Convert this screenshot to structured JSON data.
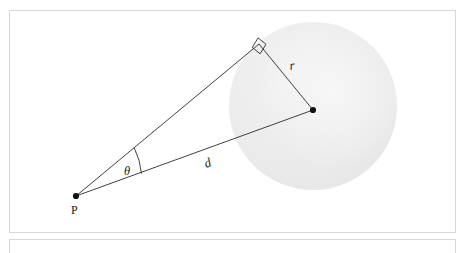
{
  "figure": {
    "type": "geometry-diagram",
    "background_color": "#ffffff",
    "frame_border_color": "#d8d8d8"
  },
  "diagram": {
    "circle": {
      "name": "sphere",
      "center_x": 313,
      "center_y": 106,
      "radius": 84,
      "fill_color": "#ededed",
      "highlight_color": "#f7f7f7"
    },
    "points": [
      {
        "id": "P",
        "label": "P",
        "x": 76,
        "y": 196,
        "dot": true
      },
      {
        "id": "C",
        "label": "",
        "x": 313,
        "y": 110,
        "dot": true
      },
      {
        "id": "T",
        "label": "",
        "x": 259,
        "y": 44,
        "dot": false
      }
    ],
    "segments": [
      {
        "id": "tangent",
        "from": "P",
        "to": "T",
        "label": ""
      },
      {
        "id": "radius",
        "from": "T",
        "to": "C",
        "label": "r"
      },
      {
        "id": "distance",
        "from": "P",
        "to": "C",
        "label": "d"
      }
    ],
    "labels": {
      "point_p": "P",
      "radius": "r",
      "distance": "d",
      "angle": "θ"
    },
    "angle_marker": {
      "id": "theta-arc",
      "at_point": "P",
      "between": [
        "tangent",
        "distance"
      ],
      "label": "θ"
    },
    "right_angle_marker": {
      "id": "right-angle",
      "at_point": "T",
      "between": [
        "tangent",
        "radius"
      ],
      "label": ""
    },
    "stroke_color": "#2b2b2b",
    "stroke_width": 0.9
  }
}
